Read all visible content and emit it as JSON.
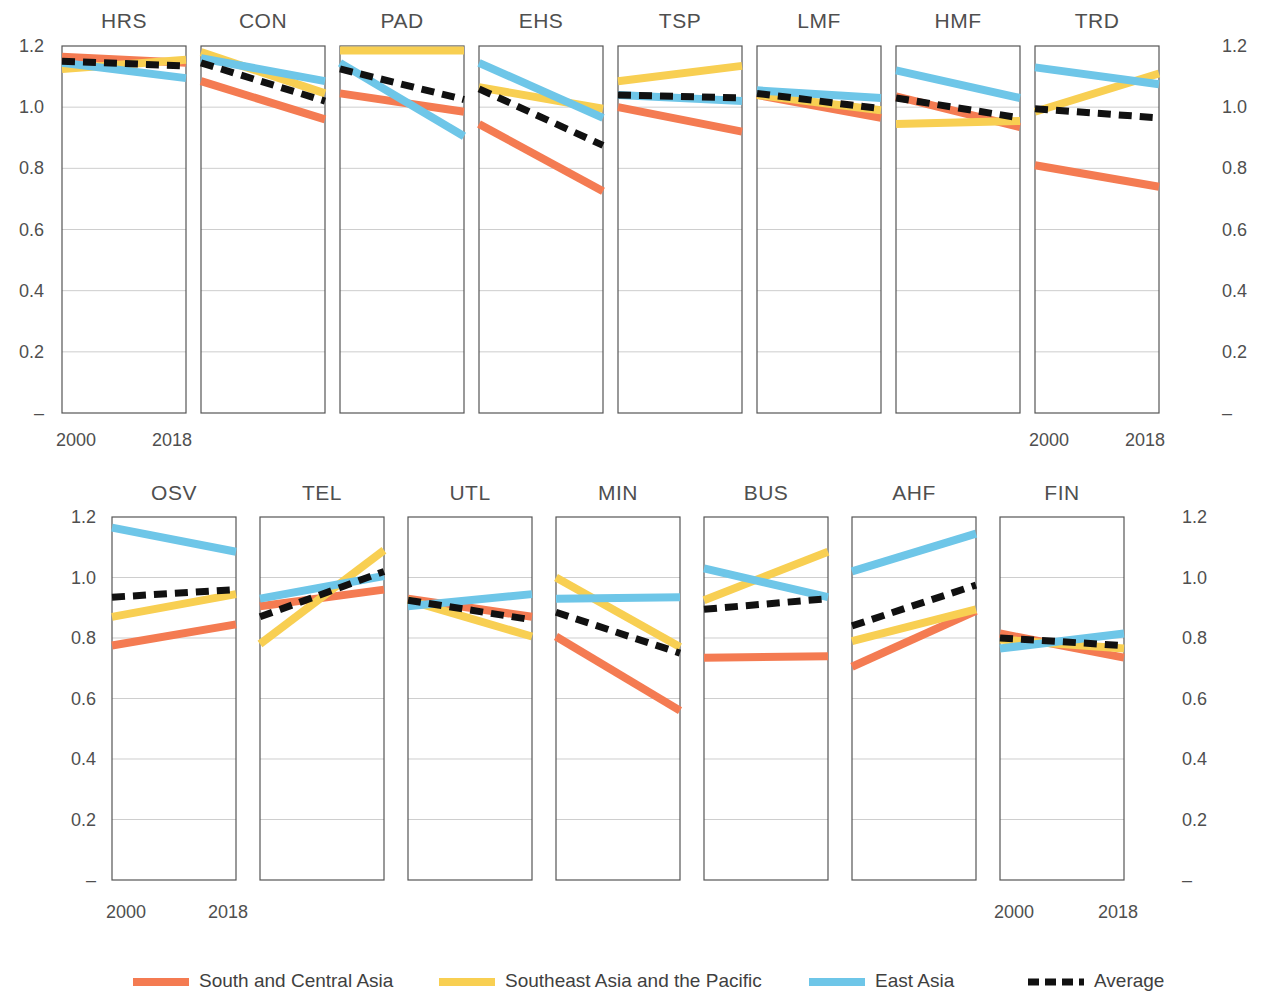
{
  "figure": {
    "title": "",
    "x_tick_labels": [
      "2000",
      "2018"
    ],
    "y_tick_labels": [
      "1.2",
      "1.0",
      "0.8",
      "0.6",
      "0.4",
      "0.2",
      "–"
    ],
    "y_tick_values": [
      1.2,
      1.0,
      0.8,
      0.6,
      0.4,
      0.2,
      0.0
    ],
    "ylim": [
      0,
      1.2
    ],
    "x_values": [
      2000,
      2018
    ]
  },
  "colors": {
    "south_central_asia": "#F47B52",
    "southeast_asia_pacific": "#F8CF52",
    "east_asia": "#6EC6E8",
    "average": "#111111",
    "grid": "#b9b9b9",
    "frame": "#555555",
    "text": "#4f4f4f"
  },
  "legend": {
    "position": "bottom",
    "items": [
      {
        "label": "South and Central Asia",
        "color": "#F47B52",
        "style": "solid"
      },
      {
        "label": "Southeast Asia and the Pacific",
        "color": "#F8CF52",
        "style": "solid"
      },
      {
        "label": "East Asia",
        "color": "#6EC6E8",
        "style": "solid"
      },
      {
        "label": "Average",
        "color": "#111111",
        "style": "dashed"
      }
    ]
  },
  "chart_data": {
    "type": "line",
    "title": "",
    "subtitle": "",
    "xlabel": "",
    "ylabel": "",
    "x": [
      2000,
      2018
    ],
    "xtick_labels": [
      "2000",
      "2018"
    ],
    "ylim": [
      0,
      1.2
    ],
    "ytick_labels": [
      "–",
      "0.2",
      "0.4",
      "0.6",
      "0.8",
      "1.0",
      "1.2"
    ],
    "grid": true,
    "legend": [
      "South and Central Asia",
      "Southeast Asia and the Pacific",
      "East Asia",
      "Average"
    ],
    "panel_layout": {
      "rows": 2,
      "row1_count": 8,
      "row2_count": 7
    },
    "panels": [
      {
        "name": "HRS",
        "row": 1,
        "series": [
          {
            "name": "South and Central Asia",
            "values": [
              1.165,
              1.145
            ]
          },
          {
            "name": "Southeast Asia and the Pacific",
            "values": [
              1.125,
              1.155
            ]
          },
          {
            "name": "East Asia",
            "values": [
              1.145,
              1.095
            ]
          },
          {
            "name": "Average",
            "values": [
              1.15,
              1.135
            ]
          }
        ]
      },
      {
        "name": "CON",
        "row": 1,
        "series": [
          {
            "name": "South and Central Asia",
            "values": [
              1.085,
              0.96
            ]
          },
          {
            "name": "Southeast Asia and the Pacific",
            "values": [
              1.18,
              1.045
            ]
          },
          {
            "name": "East Asia",
            "values": [
              1.16,
              1.085
            ]
          },
          {
            "name": "Average",
            "values": [
              1.145,
              1.02
            ]
          }
        ]
      },
      {
        "name": "PAD",
        "row": 1,
        "series": [
          {
            "name": "South and Central Asia",
            "values": [
              1.045,
              0.985
            ]
          },
          {
            "name": "Southeast Asia and the Pacific",
            "values": [
              1.185,
              1.185
            ]
          },
          {
            "name": "East Asia",
            "values": [
              1.145,
              0.905
            ]
          },
          {
            "name": "Average",
            "values": [
              1.125,
              1.025
            ]
          }
        ]
      },
      {
        "name": "EHS",
        "row": 1,
        "series": [
          {
            "name": "South and Central Asia",
            "values": [
              0.945,
              0.725
            ]
          },
          {
            "name": "Southeast Asia and the Pacific",
            "values": [
              1.065,
              0.995
            ]
          },
          {
            "name": "East Asia",
            "values": [
              1.145,
              0.965
            ]
          },
          {
            "name": "Average",
            "values": [
              1.06,
              0.875
            ]
          }
        ]
      },
      {
        "name": "TSP",
        "row": 1,
        "series": [
          {
            "name": "South and Central Asia",
            "values": [
              1.0,
              0.92
            ]
          },
          {
            "name": "Southeast Asia and the Pacific",
            "values": [
              1.085,
              1.135
            ]
          },
          {
            "name": "East Asia",
            "values": [
              1.04,
              1.02
            ]
          },
          {
            "name": "Average",
            "values": [
              1.04,
              1.03
            ]
          }
        ]
      },
      {
        "name": "LMF",
        "row": 1,
        "series": [
          {
            "name": "South and Central Asia",
            "values": [
              1.04,
              0.965
            ]
          },
          {
            "name": "Southeast Asia and the Pacific",
            "values": [
              1.04,
              0.99
            ]
          },
          {
            "name": "East Asia",
            "values": [
              1.055,
              1.03
            ]
          },
          {
            "name": "Average",
            "values": [
              1.045,
              0.995
            ]
          }
        ]
      },
      {
        "name": "HMF",
        "row": 1,
        "series": [
          {
            "name": "South and Central Asia",
            "values": [
              1.035,
              0.935
            ]
          },
          {
            "name": "Southeast Asia and the Pacific",
            "values": [
              0.945,
              0.955
            ]
          },
          {
            "name": "East Asia",
            "values": [
              1.12,
              1.03
            ]
          },
          {
            "name": "Average",
            "values": [
              1.03,
              0.965
            ]
          }
        ]
      },
      {
        "name": "TRD",
        "row": 1,
        "series": [
          {
            "name": "South and Central Asia",
            "values": [
              0.81,
              0.74
            ]
          },
          {
            "name": "Southeast Asia and the Pacific",
            "values": [
              0.985,
              1.11
            ]
          },
          {
            "name": "East Asia",
            "values": [
              1.13,
              1.075
            ]
          },
          {
            "name": "Average",
            "values": [
              0.995,
              0.965
            ]
          }
        ]
      },
      {
        "name": "OSV",
        "row": 2,
        "series": [
          {
            "name": "South and Central Asia",
            "values": [
              0.775,
              0.845
            ]
          },
          {
            "name": "Southeast Asia and the Pacific",
            "values": [
              0.87,
              0.945
            ]
          },
          {
            "name": "East Asia",
            "values": [
              1.165,
              1.085
            ]
          },
          {
            "name": "Average",
            "values": [
              0.935,
              0.96
            ]
          }
        ]
      },
      {
        "name": "TEL",
        "row": 2,
        "series": [
          {
            "name": "South and Central Asia",
            "values": [
              0.905,
              0.96
            ]
          },
          {
            "name": "Southeast Asia and the Pacific",
            "values": [
              0.78,
              1.09
            ]
          },
          {
            "name": "East Asia",
            "values": [
              0.93,
              1.005
            ]
          },
          {
            "name": "Average",
            "values": [
              0.87,
              1.02
            ]
          }
        ]
      },
      {
        "name": "UTL",
        "row": 2,
        "series": [
          {
            "name": "South and Central Asia",
            "values": [
              0.93,
              0.87
            ]
          },
          {
            "name": "Southeast Asia and the Pacific",
            "values": [
              0.925,
              0.805
            ]
          },
          {
            "name": "East Asia",
            "values": [
              0.905,
              0.945
            ]
          },
          {
            "name": "Average",
            "values": [
              0.925,
              0.86
            ]
          }
        ]
      },
      {
        "name": "MIN",
        "row": 2,
        "series": [
          {
            "name": "South and Central Asia",
            "values": [
              0.805,
              0.56
            ]
          },
          {
            "name": "Southeast Asia and the Pacific",
            "values": [
              1.0,
              0.77
            ]
          },
          {
            "name": "East Asia",
            "values": [
              0.93,
              0.935
            ]
          },
          {
            "name": "Average",
            "values": [
              0.885,
              0.75
            ]
          }
        ]
      },
      {
        "name": "BUS",
        "row": 2,
        "series": [
          {
            "name": "South and Central Asia",
            "values": [
              0.735,
              0.74
            ]
          },
          {
            "name": "Southeast Asia and the Pacific",
            "values": [
              0.925,
              1.085
            ]
          },
          {
            "name": "East Asia",
            "values": [
              1.03,
              0.935
            ]
          },
          {
            "name": "Average",
            "values": [
              0.895,
              0.93
            ]
          }
        ]
      },
      {
        "name": "AHF",
        "row": 2,
        "series": [
          {
            "name": "South and Central Asia",
            "values": [
              0.705,
              0.89
            ]
          },
          {
            "name": "Southeast Asia and the Pacific",
            "values": [
              0.79,
              0.895
            ]
          },
          {
            "name": "East Asia",
            "values": [
              1.02,
              1.145
            ]
          },
          {
            "name": "Average",
            "values": [
              0.84,
              0.975
            ]
          }
        ]
      },
      {
        "name": "FIN",
        "row": 2,
        "series": [
          {
            "name": "South and Central Asia",
            "values": [
              0.815,
              0.735
            ]
          },
          {
            "name": "Southeast Asia and the Pacific",
            "values": [
              0.795,
              0.765
            ]
          },
          {
            "name": "East Asia",
            "values": [
              0.765,
              0.815
            ]
          },
          {
            "name": "Average",
            "values": [
              0.8,
              0.775
            ]
          }
        ]
      }
    ]
  }
}
